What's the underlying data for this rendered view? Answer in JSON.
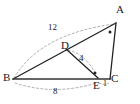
{
  "figure": {
    "type": "geometry-diagram",
    "title": "",
    "background_color": "#ffffff",
    "solid_stroke_color": "#222222",
    "dashed_stroke_color": "#999999",
    "label_color": "#1a1a1a",
    "vertices": [
      {
        "name": "A",
        "label": "A",
        "x": 116,
        "y": 22
      },
      {
        "name": "B",
        "label": "B",
        "x": 13,
        "y": 79
      },
      {
        "name": "C",
        "label": "C",
        "x": 110,
        "y": 79
      },
      {
        "name": "D",
        "label": "D",
        "x": 66,
        "y": 48
      },
      {
        "name": "E",
        "label": "E",
        "x": 98,
        "y": 79
      }
    ],
    "segments": [
      {
        "name": "segment-BA",
        "from": "B",
        "to": "A",
        "style": "solid"
      },
      {
        "name": "segment-AC",
        "from": "A",
        "to": "C",
        "style": "solid"
      },
      {
        "name": "segment-BC",
        "from": "B",
        "to": "C",
        "style": "solid"
      },
      {
        "name": "segment-DE",
        "from": "D",
        "to": "E",
        "style": "solid"
      }
    ],
    "measures": [
      {
        "name": "measure-BA",
        "label": "12",
        "x": 53,
        "y": 28,
        "arc": "B-to-A"
      },
      {
        "name": "measure-DE",
        "label": "4",
        "x": 80,
        "y": 58,
        "arc": "D-to-E"
      },
      {
        "name": "measure-BE",
        "label": "8",
        "x": 55,
        "y": 92,
        "arc": "B-to-E"
      },
      {
        "name": "measure-EC",
        "label": "1",
        "x": 104,
        "y": 85,
        "arc": "E-to-C"
      }
    ],
    "angle_markers": [
      {
        "name": "angle-marker-A",
        "x": 110,
        "y": 32
      },
      {
        "name": "angle-marker-E",
        "x": 95,
        "y": 73
      }
    ]
  }
}
